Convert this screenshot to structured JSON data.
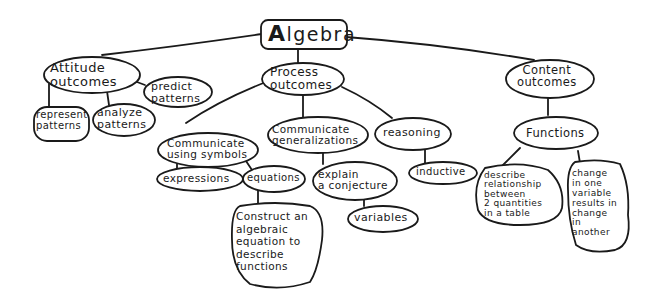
{
  "diagram": {
    "type": "concept-map",
    "style": "hand-drawn",
    "root": {
      "id": "algebra",
      "label_initial": "A",
      "label_rest": "lgebra"
    },
    "nodes": [
      {
        "id": "attitude",
        "label": "Attitude\noutcomes",
        "parent": "algebra"
      },
      {
        "id": "predict",
        "label": "predict\npatterns",
        "parent": "attitude"
      },
      {
        "id": "represent",
        "label": "represent\npatterns",
        "parent": "attitude"
      },
      {
        "id": "analyze",
        "label": "analyze\npatterns",
        "parent": "attitude"
      },
      {
        "id": "process",
        "label": "Process\noutcomes",
        "parent": "algebra"
      },
      {
        "id": "comm_symbols",
        "label": "Communicate\nusing symbols",
        "parent": "process"
      },
      {
        "id": "comm_general",
        "label": "Communicate\ngeneralizations",
        "parent": "process"
      },
      {
        "id": "reasoning",
        "label": "reasoning",
        "parent": "process"
      },
      {
        "id": "expressions",
        "label": "expressions",
        "parent": "comm_symbols"
      },
      {
        "id": "equations",
        "label": "equations",
        "parent": "comm_symbols"
      },
      {
        "id": "construct",
        "label": "Construct an\nalgebraic\nequation to\ndescribe\nfunctions",
        "parent": "equations"
      },
      {
        "id": "explain",
        "label": "explain\na conjecture",
        "parent": "comm_general"
      },
      {
        "id": "variables",
        "label": "variables",
        "parent": "explain"
      },
      {
        "id": "inductive",
        "label": "inductive",
        "parent": "reasoning"
      },
      {
        "id": "content",
        "label": "Content\noutcomes",
        "parent": "algebra"
      },
      {
        "id": "functions",
        "label": "Functions",
        "parent": "content"
      },
      {
        "id": "describe",
        "label": "describe\nrelationship\nbetween\n2 quantities\nin a table",
        "parent": "functions"
      },
      {
        "id": "change",
        "label": "change\nin one\nvariable\nresults in\nchange\nin\nanother",
        "parent": "functions"
      }
    ]
  }
}
